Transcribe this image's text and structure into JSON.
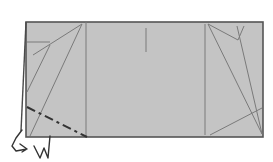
{
  "diagram": {
    "type": "origami-fold-step",
    "colors": {
      "paper": "#c4c4c4",
      "outline": "#555555",
      "crease": "#7a7a7a",
      "valley_fold": "#333333",
      "background": "#ffffff"
    },
    "paper": {
      "x": 26,
      "y": 22,
      "width": 237,
      "height": 115
    },
    "creases": [
      {
        "name": "left-panel-divider",
        "x1": 86,
        "y1": 22,
        "x2": 86,
        "y2": 137
      },
      {
        "name": "right-panel-divider",
        "x1": 205,
        "y1": 24,
        "x2": 205,
        "y2": 135
      },
      {
        "name": "center-tick",
        "x1": 146,
        "y1": 28,
        "x2": 146,
        "y2": 52
      },
      {
        "name": "left-horizontal-stub",
        "x1": 27,
        "y1": 42,
        "x2": 50,
        "y2": 42
      },
      {
        "name": "left-diagonal-a",
        "x1": 82,
        "y1": 24,
        "x2": 33,
        "y2": 55
      },
      {
        "name": "left-diagonal-b",
        "x1": 82,
        "y1": 24,
        "x2": 30,
        "y2": 136
      },
      {
        "name": "left-diagonal-c",
        "x1": 50,
        "y1": 45,
        "x2": 27,
        "y2": 92
      },
      {
        "name": "right-diagonal-a",
        "x1": 208,
        "y1": 24,
        "x2": 262,
        "y2": 134
      },
      {
        "name": "right-diagonal-b",
        "x1": 208,
        "y1": 24,
        "x2": 238,
        "y2": 40
      },
      {
        "name": "right-diagonal-c",
        "x1": 238,
        "y1": 40,
        "x2": 244,
        "y2": 26
      },
      {
        "name": "right-diagonal-d",
        "x1": 237,
        "y1": 26,
        "x2": 262,
        "y2": 134
      },
      {
        "name": "right-diagonal-e",
        "x1": 210,
        "y1": 135,
        "x2": 262,
        "y2": 108
      }
    ],
    "folded_edge": {
      "x1": 26,
      "y1": 22,
      "x2": 21,
      "y2": 131
    },
    "valley_fold_line": {
      "x1": 27,
      "y1": 107,
      "x2": 87,
      "y2": 137
    },
    "arrows": [
      {
        "name": "fold-behind-arrow",
        "path": "M22 130 L16 138 L12 146 L16 151 L27 149 M20 144 L27 149 L22 152"
      },
      {
        "name": "turn-over-arrow",
        "path": "M34 146 L40 158 L44 148 L48 158 L50 136"
      }
    ],
    "caption": "Valley fold the bottom-left corner; fold the flap behind"
  }
}
